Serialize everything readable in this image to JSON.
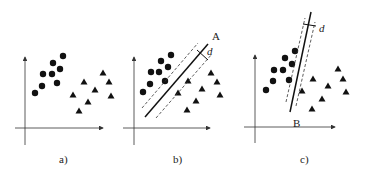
{
  "figure": {
    "panels": [
      {
        "id": "a",
        "caption": "a)",
        "axes": {
          "origin": [
            25,
            128
          ],
          "x_end": 103,
          "y_end": 57,
          "x_start": 15,
          "y_start": 145
        },
        "circles": [
          [
            63,
            56
          ],
          [
            53,
            63
          ],
          [
            60,
            69
          ],
          [
            43,
            74
          ],
          [
            52,
            74
          ],
          [
            42,
            86
          ],
          [
            57,
            83
          ],
          [
            35,
            93
          ]
        ],
        "triangles": [
          [
            103,
            73
          ],
          [
            84,
            82
          ],
          [
            109,
            82
          ],
          [
            95,
            90
          ],
          [
            73,
            95
          ],
          [
            111,
            96
          ],
          [
            88,
            102
          ],
          [
            79,
            111
          ]
        ],
        "caption_pos": [
          59,
          163
        ]
      },
      {
        "id": "b",
        "caption": "b)",
        "line_label": "A",
        "margin_label": "d",
        "axes": {
          "origin": [
            134,
            128
          ],
          "x_end": 210,
          "y_end": 57,
          "x_start": 123,
          "y_start": 145
        },
        "circles": [
          [
            171,
            55
          ],
          [
            161,
            61
          ],
          [
            168,
            67
          ],
          [
            151,
            72
          ],
          [
            159,
            72
          ],
          [
            150,
            84
          ],
          [
            165,
            81
          ],
          [
            143,
            92
          ]
        ],
        "triangles": [
          [
            211,
            73
          ],
          [
            188,
            81
          ],
          [
            217,
            82
          ],
          [
            202,
            89
          ],
          [
            178,
            93
          ],
          [
            220,
            95
          ],
          [
            196,
            101
          ],
          [
            187,
            110
          ]
        ],
        "line": [
          [
            145,
            117
          ],
          [
            208,
            44
          ]
        ],
        "dash1": [
          [
            142,
            108
          ],
          [
            198,
            43
          ]
        ],
        "dash2": [
          [
            156,
            118
          ],
          [
            212,
            54
          ]
        ],
        "margin_tick": [
          [
            197,
            50
          ],
          [
            208,
            60
          ]
        ],
        "line_label_pos": [
          212,
          40
        ],
        "margin_label_pos": [
          207,
          55
        ],
        "caption_pos": [
          173,
          163
        ]
      },
      {
        "id": "c",
        "caption": "c)",
        "line_label": "B",
        "margin_label": "d",
        "axes": {
          "origin": [
            255,
            127
          ],
          "x_end": 335,
          "y_end": 55,
          "x_start": 244,
          "y_start": 143
        },
        "circles": [
          [
            295,
            51
          ],
          [
            285,
            58
          ],
          [
            292,
            64
          ],
          [
            274,
            70
          ],
          [
            283,
            70
          ],
          [
            273,
            81
          ],
          [
            289,
            80
          ],
          [
            266,
            90
          ]
        ],
        "triangles": [
          [
            338,
            69
          ],
          [
            313,
            79
          ],
          [
            343,
            79
          ],
          [
            328,
            86
          ],
          [
            302,
            91
          ],
          [
            346,
            92
          ],
          [
            322,
            99
          ],
          [
            312,
            109
          ]
        ],
        "line": [
          [
            290,
            112
          ],
          [
            311,
            12
          ]
        ],
        "dash1": [
          [
            286,
            102
          ],
          [
            305,
            18
          ]
        ],
        "dash2": [
          [
            296,
            106
          ],
          [
            315,
            22
          ]
        ],
        "margin_tick": [
          [
            303,
            24
          ],
          [
            316,
            26
          ]
        ],
        "line_label_pos": [
          293,
          127
        ],
        "margin_label_pos": [
          319,
          32
        ],
        "caption_pos": [
          300,
          163
        ]
      }
    ],
    "colors": {
      "ink": "#111111",
      "background": "#ffffff"
    }
  }
}
